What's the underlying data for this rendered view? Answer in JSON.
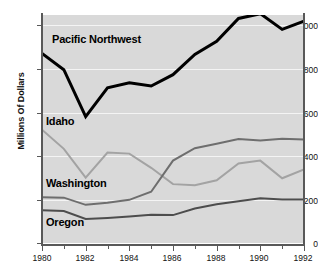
{
  "chart_data": {
    "type": "line",
    "title": "",
    "subtitle": "",
    "xlabel": "",
    "ylabel": "Millions Of Dollars",
    "x": [
      1980,
      1981,
      1982,
      1983,
      1984,
      1985,
      1986,
      1987,
      1988,
      1989,
      1990,
      1991,
      1992
    ],
    "xlim": [
      1980,
      1992
    ],
    "ylim": [
      0,
      1000
    ],
    "grid": true,
    "legend_position": "inline-labels",
    "xtick_labels": [
      "1980",
      "1982",
      "1984",
      "1986",
      "1988",
      "1990",
      "1992"
    ],
    "xtick_values": [
      1980,
      1982,
      1984,
      1986,
      1988,
      1990,
      1992
    ],
    "xtick_minor_values": [
      1981,
      1983,
      1985,
      1987,
      1989,
      1991
    ],
    "ytick_labels": [
      "0",
      "200",
      "400",
      "600",
      "800",
      "1,000"
    ],
    "ytick_values": [
      0,
      200,
      400,
      600,
      800,
      1000
    ],
    "series": [
      {
        "name": "Pacific Northwest",
        "color": "#000000",
        "width": 3,
        "values": [
          870,
          795,
          580,
          712,
          735,
          720,
          772,
          865,
          925,
          1030,
          1052,
          980,
          1018
        ]
      },
      {
        "name": "Idaho",
        "color": "#a3a3a3",
        "width": 2,
        "values": [
          520,
          432,
          300,
          415,
          410,
          345,
          270,
          265,
          288,
          365,
          378,
          297,
          338
        ]
      },
      {
        "name": "Washington",
        "color": "#6e6e6e",
        "width": 2,
        "values": [
          210,
          208,
          175,
          185,
          198,
          235,
          378,
          435,
          455,
          477,
          470,
          478,
          475
        ]
      },
      {
        "name": "Oregon",
        "color": "#4d4d4d",
        "width": 2,
        "values": [
          150,
          147,
          110,
          115,
          122,
          130,
          128,
          158,
          178,
          192,
          205,
          200,
          200
        ]
      }
    ],
    "annotations": [
      {
        "text": "Pacific Northwest",
        "x_px": 52,
        "y_px": 39
      },
      {
        "text": "Idaho",
        "x_px": 46,
        "y_px": 121
      },
      {
        "text": "Washington",
        "x_px": 46,
        "y_px": 183
      },
      {
        "text": "Oregon",
        "x_px": 46,
        "y_px": 222
      }
    ],
    "colors": {
      "plot_background": "#d9d9d9",
      "page_background": "#ffffff",
      "gridline": "#f4f4f4",
      "axis": "#595959",
      "text": "#111111"
    }
  }
}
